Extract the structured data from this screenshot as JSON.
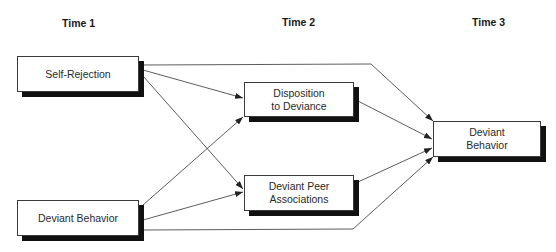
{
  "headers": {
    "time1": "Time 1",
    "time2": "Time 2",
    "time3": "Time 3"
  },
  "nodes": {
    "self_rejection": "Self-Rejection",
    "deviant_behavior_t1": "Deviant Behavior",
    "disposition_line1": "Disposition",
    "disposition_line2": "to Deviance",
    "peer_line1": "Deviant Peer",
    "peer_line2": "Associations",
    "deviant_behavior_t3_line1": "Deviant",
    "deviant_behavior_t3_line2": "Behavior"
  },
  "edges": [
    {
      "from": "Self-Rejection",
      "to": "Disposition to Deviance"
    },
    {
      "from": "Self-Rejection",
      "to": "Deviant Peer Associations"
    },
    {
      "from": "Self-Rejection",
      "to": "Deviant Behavior (Time 3)"
    },
    {
      "from": "Deviant Behavior (Time 1)",
      "to": "Disposition to Deviance"
    },
    {
      "from": "Deviant Behavior (Time 1)",
      "to": "Deviant Peer Associations"
    },
    {
      "from": "Deviant Behavior (Time 1)",
      "to": "Deviant Behavior (Time 3)"
    },
    {
      "from": "Disposition to Deviance",
      "to": "Deviant Behavior (Time 3)"
    },
    {
      "from": "Deviant Peer Associations",
      "to": "Deviant Behavior (Time 3)"
    }
  ]
}
